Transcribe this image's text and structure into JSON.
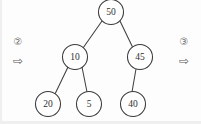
{
  "canvas": {
    "width": 201,
    "height": 124,
    "background_color": "#fdfdfd",
    "stroke_color": "#3a3a3a",
    "text_color": "#2e2e2e"
  },
  "diagram": {
    "type": "binary-tree",
    "nodes": [
      {
        "id": "n50",
        "label": "50",
        "cx": 111,
        "cy": 12,
        "r": 12.5,
        "level": 0
      },
      {
        "id": "n10",
        "label": "10",
        "cx": 75,
        "cy": 57,
        "r": 12.5,
        "level": 1
      },
      {
        "id": "n45",
        "label": "45",
        "cx": 140,
        "cy": 57,
        "r": 12.5,
        "level": 1
      },
      {
        "id": "n20",
        "label": "20",
        "cx": 48,
        "cy": 104,
        "r": 12.5,
        "level": 2
      },
      {
        "id": "n5",
        "label": "5",
        "cx": 89,
        "cy": 104,
        "r": 12.5,
        "level": 2
      },
      {
        "id": "n40",
        "label": "40",
        "cx": 133,
        "cy": 104,
        "r": 12.5,
        "level": 2
      }
    ],
    "edges": [
      {
        "id": "e50-10",
        "from": "n50",
        "to": "n10",
        "x1": 102,
        "y1": 21,
        "x2": 83,
        "y2": 48
      },
      {
        "id": "e50-45",
        "from": "n50",
        "to": "n45",
        "x1": 120,
        "y1": 21,
        "x2": 133,
        "y2": 48
      },
      {
        "id": "e10-20",
        "from": "n10",
        "to": "n20",
        "x1": 68,
        "y1": 67,
        "x2": 55,
        "y2": 94
      },
      {
        "id": "e10-5",
        "from": "n10",
        "to": "n5",
        "x1": 82,
        "y1": 67,
        "x2": 87,
        "y2": 92
      },
      {
        "id": "e45-40",
        "from": "n45",
        "to": "n40",
        "x1": 136,
        "y1": 69,
        "x2": 132,
        "y2": 92
      }
    ]
  },
  "markers": {
    "left": {
      "symbol": "②",
      "symbol_name": "circled-number-two",
      "arrow": "⇨",
      "arrow_name": "right-arrow",
      "symbol_x": 18,
      "symbol_y": 42,
      "arrow_x": 18,
      "arrow_y": 61
    },
    "right": {
      "symbol": "③",
      "symbol_name": "circled-number-three",
      "arrow": "⇨",
      "arrow_name": "right-arrow",
      "symbol_x": 184,
      "symbol_y": 42,
      "arrow_x": 184,
      "arrow_y": 61
    }
  }
}
